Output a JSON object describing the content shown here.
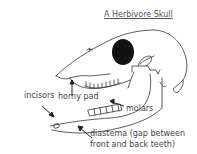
{
  "diagram": {
    "title": "A Herbivore Skull",
    "labels": {
      "horny_pad": "horny pad",
      "incisors": "incisors",
      "molars": "molars",
      "diastema_line1": "diastema (gap between",
      "diastema_line2": "front and back teeth)"
    },
    "colors": {
      "stroke": "#333333",
      "eye_socket": "#111111",
      "text": "#444444"
    }
  }
}
